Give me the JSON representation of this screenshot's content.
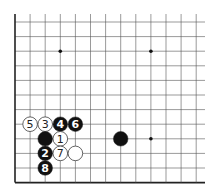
{
  "diagram": {
    "type": "go-board-fragment",
    "columns": 13,
    "rows": 12,
    "edges": [
      "left",
      "bottom"
    ],
    "colors": {
      "background": "#ffffff",
      "line": "#555555",
      "edge": "#222222",
      "black_stone": "#111111",
      "white_stone": "#ffffff",
      "star_point": "#111111"
    },
    "star_points": [
      {
        "col": 3,
        "row": 2
      },
      {
        "col": 9,
        "row": 2
      },
      {
        "col": 9,
        "row": 8
      }
    ],
    "stones": [
      {
        "color": "white",
        "col": 1,
        "row": 7,
        "label": "5"
      },
      {
        "color": "white",
        "col": 2,
        "row": 7,
        "label": "3"
      },
      {
        "color": "black",
        "col": 3,
        "row": 7,
        "label": "4"
      },
      {
        "color": "black",
        "col": 4,
        "row": 7,
        "label": "6"
      },
      {
        "color": "black",
        "col": 2,
        "row": 8,
        "label": ""
      },
      {
        "color": "white",
        "col": 3,
        "row": 8,
        "label": "1"
      },
      {
        "color": "black",
        "col": 2,
        "row": 9,
        "label": "2"
      },
      {
        "color": "white",
        "col": 3,
        "row": 9,
        "label": "7"
      },
      {
        "color": "white",
        "col": 4,
        "row": 9,
        "label": ""
      },
      {
        "color": "black",
        "col": 2,
        "row": 10,
        "label": "8"
      },
      {
        "color": "black",
        "col": 7,
        "row": 8,
        "label": ""
      }
    ]
  }
}
